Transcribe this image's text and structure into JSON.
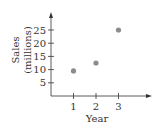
{
  "chart_data": {
    "type": "scatter",
    "title": "",
    "xlabel": "Year",
    "ylabel": "Sales (millions)",
    "ylabel_lines": [
      "Sales",
      "(millions)"
    ],
    "x": [
      1,
      2,
      3
    ],
    "y": [
      9.5,
      12.5,
      25
    ],
    "x_ticks": [
      1,
      2,
      3
    ],
    "y_ticks": [
      5,
      10,
      15,
      20,
      25
    ],
    "xlim": [
      0,
      4.2
    ],
    "ylim": [
      0,
      31
    ],
    "grid": false,
    "legend": null,
    "colors": {
      "point": "#8c8c8c",
      "axis": "#333333"
    }
  }
}
